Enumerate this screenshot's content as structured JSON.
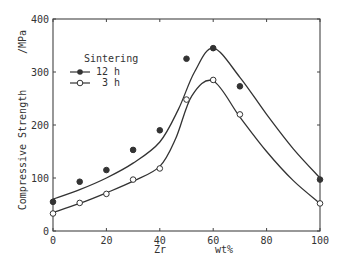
{
  "chart_data": {
    "type": "line",
    "title": "",
    "xlabel": "Zr",
    "xunit": "wt%",
    "ylabel": "Compressive Strength",
    "yunit": "/MPa",
    "xlim": [
      0,
      100
    ],
    "ylim": [
      0,
      400
    ],
    "xticks": [
      0,
      20,
      40,
      60,
      80,
      100
    ],
    "yticks": [
      0,
      100,
      200,
      300,
      400
    ],
    "grid": false,
    "legend": {
      "title": "Sintering",
      "position": "upper-left"
    },
    "series": [
      {
        "name": "12 h",
        "marker": "filled-circle",
        "x": [
          0,
          10,
          20,
          30,
          40,
          50,
          60,
          70,
          100
        ],
        "values": [
          55,
          93,
          115,
          153,
          190,
          325,
          345,
          273,
          97
        ]
      },
      {
        "name": "3 h",
        "marker": "open-circle",
        "x": [
          0,
          10,
          20,
          30,
          40,
          50,
          60,
          70,
          100
        ],
        "values": [
          33,
          53,
          70,
          97,
          118,
          248,
          285,
          220,
          52
        ]
      }
    ]
  }
}
